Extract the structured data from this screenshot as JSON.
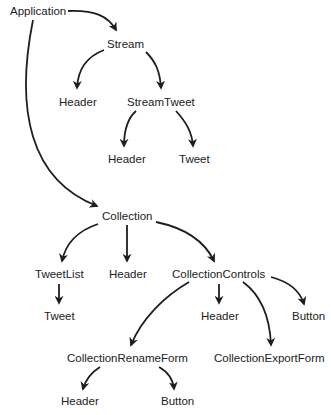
{
  "diagram": {
    "colors": {
      "text": "#222222",
      "edge": "#1e1e1e",
      "background": "#ffffff"
    },
    "nodes": [
      {
        "id": "application",
        "label": "Application"
      },
      {
        "id": "stream",
        "label": "Stream"
      },
      {
        "id": "stream-header",
        "label": "Header"
      },
      {
        "id": "stream-tweet",
        "label": "StreamTweet"
      },
      {
        "id": "streamtweet-header",
        "label": "Header"
      },
      {
        "id": "streamtweet-tweet",
        "label": "Tweet"
      },
      {
        "id": "collection",
        "label": "Collection"
      },
      {
        "id": "tweet-list",
        "label": "TweetList"
      },
      {
        "id": "collection-header",
        "label": "Header"
      },
      {
        "id": "collection-controls",
        "label": "CollectionControls"
      },
      {
        "id": "tweetlist-tweet",
        "label": "Tweet"
      },
      {
        "id": "controls-header",
        "label": "Header"
      },
      {
        "id": "controls-button",
        "label": "Button"
      },
      {
        "id": "collection-rename-form",
        "label": "CollectionRenameForm"
      },
      {
        "id": "collection-export-form",
        "label": "CollectionExportForm"
      },
      {
        "id": "renameform-header",
        "label": "Header"
      },
      {
        "id": "renameform-button",
        "label": "Button"
      }
    ],
    "edges": [
      {
        "from": "application",
        "to": "stream"
      },
      {
        "from": "application",
        "to": "collection"
      },
      {
        "from": "stream",
        "to": "stream-header"
      },
      {
        "from": "stream",
        "to": "stream-tweet"
      },
      {
        "from": "stream-tweet",
        "to": "streamtweet-header"
      },
      {
        "from": "stream-tweet",
        "to": "streamtweet-tweet"
      },
      {
        "from": "collection",
        "to": "tweet-list"
      },
      {
        "from": "collection",
        "to": "collection-header"
      },
      {
        "from": "collection",
        "to": "collection-controls"
      },
      {
        "from": "tweet-list",
        "to": "tweetlist-tweet"
      },
      {
        "from": "collection-controls",
        "to": "collection-rename-form"
      },
      {
        "from": "collection-controls",
        "to": "controls-header"
      },
      {
        "from": "collection-controls",
        "to": "collection-export-form"
      },
      {
        "from": "collection-controls",
        "to": "controls-button"
      },
      {
        "from": "collection-rename-form",
        "to": "renameform-header"
      },
      {
        "from": "collection-rename-form",
        "to": "renameform-button"
      }
    ]
  }
}
